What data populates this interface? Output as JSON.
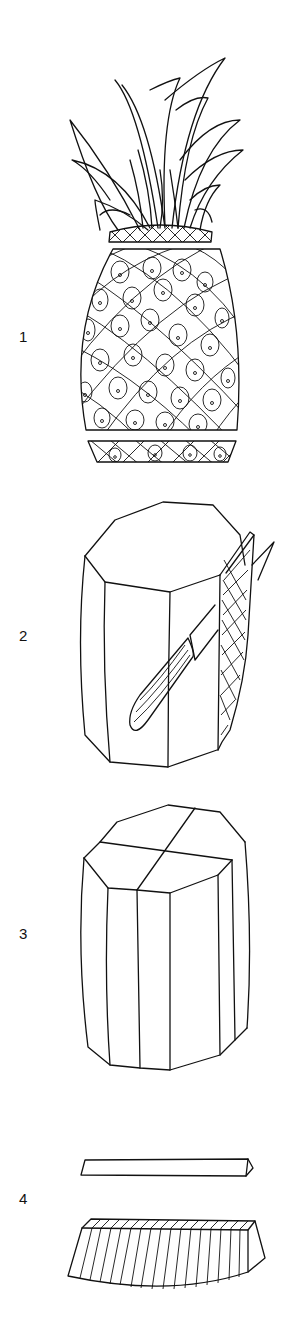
{
  "steps": [
    {
      "number": "1",
      "description": "whole-pineapple-top-and-base-cut"
    },
    {
      "number": "2",
      "description": "peel-sides-with-knife"
    },
    {
      "number": "3",
      "description": "cut-peeled-pineapple-into-quarters"
    },
    {
      "number": "4",
      "description": "remove-core-and-slice-quarter"
    }
  ],
  "colors": {
    "line": "#111111",
    "background": "#ffffff"
  }
}
